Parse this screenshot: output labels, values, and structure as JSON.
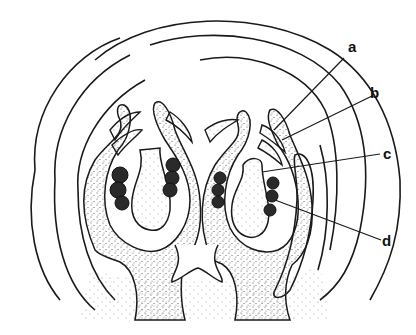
{
  "diagram": {
    "type": "botanical-section",
    "colors": {
      "line": "#1a1a1a",
      "stipple": "#555555",
      "background": "#ffffff",
      "spore": "#2a2a2a"
    },
    "labels": [
      {
        "id": "a",
        "text": "a",
        "x": 348,
        "y": 53
      },
      {
        "id": "b",
        "text": "b",
        "x": 376,
        "y": 91
      },
      {
        "id": "c",
        "text": "c",
        "x": 383,
        "y": 156
      },
      {
        "id": "d",
        "text": "d",
        "x": 383,
        "y": 240
      }
    ]
  }
}
